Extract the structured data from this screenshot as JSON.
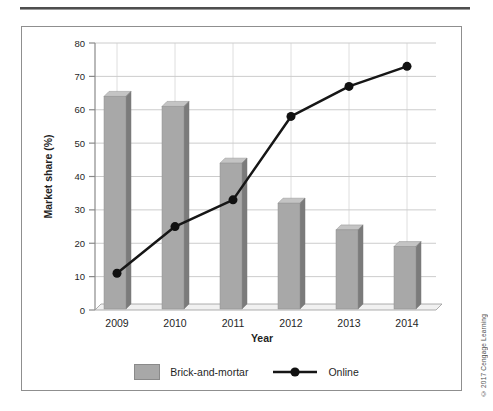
{
  "page": {
    "clipped_title": "Percentage of consumers who purchased books at online and brick-and-mortar stores",
    "copyright": "© 2017 Cengage Learning"
  },
  "chart_data": {
    "type": "bar",
    "subtype": "bar-and-line-combo",
    "categories": [
      "2009",
      "2010",
      "2011",
      "2012",
      "2013",
      "2014"
    ],
    "series": [
      {
        "name": "Brick-and-mortar",
        "type": "bar",
        "values": [
          64,
          61,
          44,
          32,
          24,
          19
        ],
        "color": "#a8a8a8",
        "color_top": "#c4c4c4",
        "color_side": "#7b7b7b"
      },
      {
        "name": "Online",
        "type": "line",
        "values": [
          11,
          25,
          33,
          58,
          67,
          73
        ],
        "color": "#161616"
      }
    ],
    "xlabel": "Year",
    "ylabel": "Market share (%)",
    "ylim": [
      0,
      80
    ],
    "yticks": [
      0,
      10,
      20,
      30,
      40,
      50,
      60,
      70,
      80
    ],
    "grid": true,
    "legend_position": "bottom"
  }
}
